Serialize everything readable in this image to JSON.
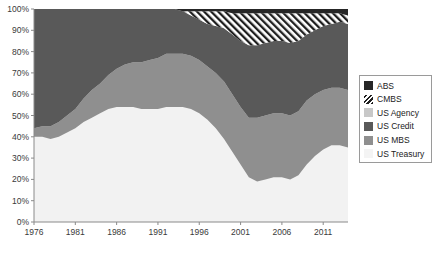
{
  "chart_data": {
    "type": "area",
    "stacked": true,
    "normalized": true,
    "title": "",
    "subtitle": "",
    "xlabel": "",
    "ylabel": "",
    "xlim": [
      1976,
      2014
    ],
    "ylim": [
      0,
      100
    ],
    "grid": false,
    "legend_position": "right",
    "x_ticks": [
      "1976",
      "1981",
      "1986",
      "1991",
      "1996",
      "2001",
      "2006",
      "2011"
    ],
    "x_tick_values": [
      1976,
      1981,
      1986,
      1991,
      1996,
      2001,
      2006,
      2011
    ],
    "y_ticks": [
      "0%",
      "10%",
      "20%",
      "30%",
      "40%",
      "50%",
      "60%",
      "70%",
      "80%",
      "90%",
      "100%"
    ],
    "y_tick_values": [
      0,
      10,
      20,
      30,
      40,
      50,
      60,
      70,
      80,
      90,
      100
    ],
    "x": [
      1976,
      1977,
      1978,
      1979,
      1980,
      1981,
      1982,
      1983,
      1984,
      1985,
      1986,
      1987,
      1988,
      1989,
      1990,
      1991,
      1992,
      1993,
      1994,
      1995,
      1996,
      1997,
      1998,
      1999,
      2000,
      2001,
      2002,
      2003,
      2004,
      2005,
      2006,
      2007,
      2008,
      2009,
      2010,
      2011,
      2012,
      2013,
      2014
    ],
    "series": [
      {
        "name": "US Treasury",
        "color": "#f2f2f2",
        "pattern": "solid",
        "values": [
          40,
          40,
          39,
          40,
          42,
          44,
          47,
          49,
          51,
          53,
          54,
          54,
          54,
          53,
          53,
          53,
          54,
          54,
          54,
          53,
          51,
          48,
          44,
          39,
          33,
          27,
          21,
          19,
          20,
          21,
          21,
          20,
          22,
          27,
          31,
          34,
          36,
          36,
          35
        ]
      },
      {
        "name": "US MBS",
        "color": "#8f8f8f",
        "pattern": "solid",
        "values": [
          4,
          5,
          6,
          7,
          8,
          9,
          11,
          13,
          14,
          16,
          18,
          20,
          21,
          22,
          23,
          24,
          25,
          25,
          25,
          25,
          25,
          25,
          26,
          27,
          27,
          27,
          28,
          30,
          30,
          30,
          30,
          30,
          30,
          30,
          29,
          28,
          27,
          27,
          27
        ]
      },
      {
        "name": "US Credit",
        "color": "#595959",
        "pattern": "solid",
        "values": [
          56,
          55,
          55,
          53,
          50,
          47,
          42,
          38,
          35,
          31,
          28,
          26,
          25,
          25,
          24,
          23,
          21,
          21,
          20,
          19,
          19,
          20,
          22,
          25,
          28,
          31,
          34,
          34,
          34,
          34,
          34,
          34,
          33,
          31,
          30,
          30,
          30,
          31,
          31
        ]
      },
      {
        "name": "US Agency",
        "color": "#c8c8c8",
        "pattern": "solid",
        "values": [
          0,
          0,
          0,
          0,
          0,
          0,
          0,
          0,
          0,
          0,
          0,
          0,
          0,
          0,
          0,
          0,
          0,
          0,
          0,
          0,
          0,
          0,
          0,
          0,
          0,
          0,
          0,
          0,
          0,
          0,
          0,
          0,
          0,
          0,
          0,
          0,
          0,
          0,
          0
        ]
      },
      {
        "name": "CMBS",
        "color": "#ffffff",
        "pattern": "diagonal-hatch",
        "values": [
          0,
          0,
          0,
          0,
          0,
          0,
          0,
          0,
          0,
          0,
          0,
          0,
          0,
          0,
          0,
          0,
          0,
          0,
          0,
          2,
          4,
          6,
          7,
          8,
          10,
          13,
          15,
          15,
          14,
          13,
          13,
          14,
          13,
          10,
          8,
          6,
          5,
          4,
          4
        ]
      },
      {
        "name": "ABS",
        "color": "#262626",
        "pattern": "solid",
        "values": [
          0,
          0,
          0,
          0,
          0,
          0,
          0,
          0,
          0,
          0,
          0,
          0,
          0,
          0,
          0,
          0,
          0,
          0,
          1,
          1,
          1,
          1,
          1,
          1,
          2,
          2,
          2,
          2,
          2,
          2,
          2,
          2,
          2,
          2,
          2,
          2,
          2,
          2,
          3
        ]
      }
    ]
  },
  "legend": {
    "items": [
      {
        "label": "ABS",
        "color": "#262626",
        "pattern": "solid"
      },
      {
        "label": "CMBS",
        "color": "#ffffff",
        "pattern": "diagonal-hatch"
      },
      {
        "label": "US Agency",
        "color": "#c8c8c8",
        "pattern": "solid"
      },
      {
        "label": "US Credit",
        "color": "#595959",
        "pattern": "solid"
      },
      {
        "label": "US MBS",
        "color": "#8f8f8f",
        "pattern": "solid"
      },
      {
        "label": "US Treasury",
        "color": "#f4f4f4",
        "pattern": "solid"
      }
    ]
  },
  "plot_area": {
    "background": "#f2f2f2",
    "axis_color": "#8a8a8a"
  }
}
